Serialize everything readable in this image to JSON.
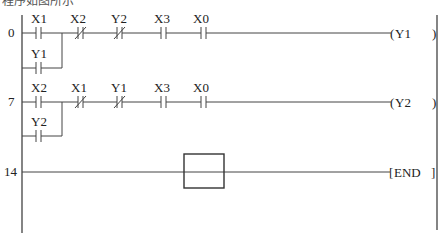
{
  "header_fragment": "程序如图所示",
  "rungs": [
    {
      "step": "0",
      "contacts": [
        {
          "label": "X1",
          "type": "NO"
        },
        {
          "label": "X2",
          "type": "NC"
        },
        {
          "label": "Y2",
          "type": "NC"
        },
        {
          "label": "X3",
          "type": "NO"
        },
        {
          "label": "X0",
          "type": "NO"
        }
      ],
      "branch": {
        "label": "Y1",
        "type": "NO"
      },
      "coil": "Y1"
    },
    {
      "step": "7",
      "contacts": [
        {
          "label": "X2",
          "type": "NO"
        },
        {
          "label": "X1",
          "type": "NC"
        },
        {
          "label": "Y1",
          "type": "NC"
        },
        {
          "label": "X3",
          "type": "NO"
        },
        {
          "label": "X0",
          "type": "NO"
        }
      ],
      "branch": {
        "label": "Y2",
        "type": "NO"
      },
      "coil": "Y2"
    },
    {
      "step": "14",
      "instruction": "END",
      "cursor_box": true
    }
  ]
}
